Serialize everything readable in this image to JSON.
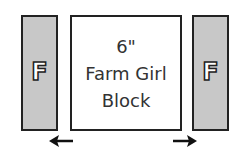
{
  "diagram": {
    "left_strip": {
      "label": "F",
      "fill": "#c8c8c8"
    },
    "center_block": {
      "line1": "6\"",
      "line2": "Farm Girl",
      "line3": "Block"
    },
    "right_strip": {
      "label": "F",
      "fill": "#c8c8c8"
    },
    "arrows": [
      "left-arrow",
      "right-arrow"
    ]
  }
}
